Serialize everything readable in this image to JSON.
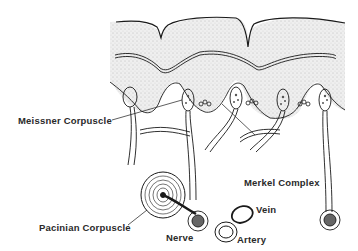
{
  "diagram": {
    "labels": {
      "meissner": "Meissner Corpuscle",
      "merkel": "Merkel Complex",
      "pacinian": "Pacinian Corpuscle",
      "nerve": "Nerve",
      "vein": "Vein",
      "artery": "Artery"
    },
    "colors": {
      "ink": "#1a1a1a",
      "stipple": "#e6e6e6",
      "background": "#ffffff"
    }
  }
}
